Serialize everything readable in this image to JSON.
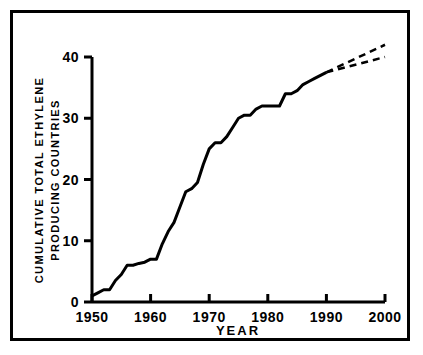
{
  "chart_data": {
    "type": "line",
    "title": "",
    "xlabel": "YEAR",
    "ylabel": "CUMULATIVE TOTAL ETHYLENE PRODUCING COUNTRIES",
    "ylabel_line1": "CUMULATIVE TOTAL ETHYLENE",
    "ylabel_line2": "PRODUCING COUNTRIES",
    "xlim": [
      1950,
      2000
    ],
    "ylim": [
      0,
      40
    ],
    "xticks": [
      1950,
      1960,
      1970,
      1980,
      1990,
      2000
    ],
    "xtick_labels": [
      "1950",
      "1960",
      "1970",
      "1980",
      "1990",
      "2000"
    ],
    "yticks": [
      0,
      10,
      20,
      30,
      40
    ],
    "ytick_labels": [
      "0",
      "10",
      "20",
      "30",
      "40"
    ],
    "grid": false,
    "legend": "none",
    "series": [
      {
        "name": "Cumulative ethylene producing countries (historical)",
        "style": "solid",
        "color": "#000000",
        "x": [
          1950,
          1951,
          1952,
          1953,
          1954,
          1955,
          1956,
          1957,
          1958,
          1959,
          1960,
          1961,
          1962,
          1963,
          1964,
          1965,
          1966,
          1967,
          1968,
          1969,
          1970,
          1971,
          1972,
          1973,
          1974,
          1975,
          1976,
          1977,
          1978,
          1979,
          1980,
          1981,
          1982,
          1983,
          1984,
          1985,
          1986,
          1987,
          1988,
          1989,
          1990
        ],
        "values": [
          1,
          1.5,
          2,
          2,
          3.5,
          4.5,
          6,
          6,
          6.3,
          6.5,
          7,
          7,
          9.5,
          11.5,
          13,
          15.5,
          18,
          18.5,
          19.5,
          22.5,
          25,
          26,
          26,
          27,
          28.5,
          30,
          30.5,
          30.5,
          31.5,
          32,
          32,
          32,
          32,
          34,
          34,
          34.5,
          35.5,
          36,
          36.5,
          37,
          37.5
        ]
      },
      {
        "name": "Projection high",
        "style": "dashed",
        "color": "#000000",
        "x": [
          1990,
          2000
        ],
        "values": [
          37.5,
          42
        ]
      },
      {
        "name": "Projection low",
        "style": "dashed",
        "color": "#000000",
        "x": [
          1990,
          2000
        ],
        "values": [
          37.5,
          40
        ]
      }
    ]
  },
  "colors": {
    "ink": "#000000",
    "paper": "#ffffff"
  }
}
